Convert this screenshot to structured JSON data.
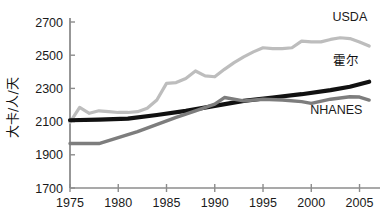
{
  "chart_data": {
    "type": "line",
    "title": "",
    "xlabel": "",
    "ylabel": "大卡/人/天",
    "xlim": [
      1975,
      2006.5
    ],
    "ylim": [
      1700,
      2700
    ],
    "grid": false,
    "legend_position": "inline-right",
    "x_ticks": [
      1975,
      1980,
      1985,
      1990,
      1995,
      2000,
      2005
    ],
    "x_tick_labels": [
      "1975",
      "1980",
      "1985",
      "1990",
      "1995",
      "2000",
      "2005"
    ],
    "y_ticks": [
      1700,
      1900,
      2100,
      2300,
      2500,
      2700
    ],
    "y_tick_labels": [
      "1700",
      "1900",
      "2100",
      "2300",
      "2500",
      "2700"
    ],
    "series": [
      {
        "name": "USDA",
        "label": "USDA",
        "color": "#bdbdbd",
        "width": 3.2,
        "x": [
          1975,
          1976,
          1977,
          1978,
          1979,
          1980,
          1981,
          1982,
          1983,
          1984,
          1985,
          1986,
          1987,
          1988,
          1989,
          1990,
          1991,
          1992,
          1993,
          1994,
          1995,
          1996,
          1997,
          1998,
          1999,
          2000,
          2001,
          2002,
          2003,
          2004,
          2005,
          2006
        ],
        "values": [
          2095,
          2185,
          2150,
          2165,
          2160,
          2155,
          2155,
          2160,
          2180,
          2230,
          2330,
          2335,
          2360,
          2405,
          2375,
          2370,
          2415,
          2455,
          2490,
          2520,
          2545,
          2540,
          2540,
          2545,
          2585,
          2580,
          2580,
          2595,
          2605,
          2600,
          2580,
          2555
        ]
      },
      {
        "name": "Hall",
        "label": "霍尔",
        "color": "#111111",
        "width": 4.2,
        "x": [
          1975,
          1978,
          1981,
          1984,
          1987,
          1990,
          1993,
          1996,
          1999,
          2002,
          2004,
          2006
        ],
        "values": [
          2108,
          2112,
          2118,
          2140,
          2165,
          2195,
          2225,
          2245,
          2265,
          2290,
          2310,
          2340
        ]
      },
      {
        "name": "NHANES",
        "label": "NHANES",
        "color": "#7d7d7d",
        "width": 3.4,
        "x": [
          1975,
          1978,
          1982,
          1986,
          1988,
          1990,
          1991,
          1993,
          1995,
          1997,
          1999,
          2000,
          2002,
          2004,
          2005,
          2006
        ],
        "values": [
          1968,
          1968,
          2040,
          2125,
          2165,
          2205,
          2245,
          2225,
          2235,
          2230,
          2220,
          2210,
          2235,
          2250,
          2248,
          2230
        ]
      }
    ],
    "annotations": [
      {
        "text": "USDA",
        "x": 2004.0,
        "y": 2705,
        "anchor": "middle",
        "cjk": false
      },
      {
        "text": "霍尔",
        "x": 2003.6,
        "y": 2440,
        "anchor": "middle",
        "cjk": true
      },
      {
        "text": "NHANES",
        "x": 2002.6,
        "y": 2145,
        "anchor": "middle",
        "cjk": false
      }
    ],
    "axis_color": "#8c8c8c",
    "text_color": "#1a1a1a"
  }
}
